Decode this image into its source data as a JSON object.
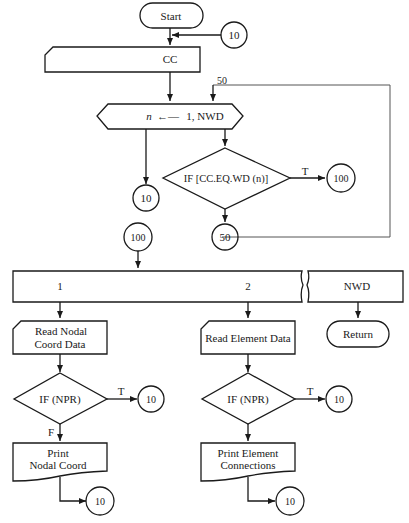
{
  "nodes": {
    "start": "Start",
    "connector_10_top": "10",
    "cc": "CC",
    "loop": {
      "var": "n",
      "range": "1, NWD"
    },
    "loop_label_50": "50",
    "if_cc": "IF [CC.EQ.WD (n)]",
    "if_cc_true": "T",
    "connector_100_right": "100",
    "connector_10_exit": "10",
    "connector_50": "50",
    "connector_100_entry": "100",
    "case_bar": {
      "case1": "1",
      "case2": "2",
      "case3": "NWD"
    },
    "read_nodal": {
      "line1": "Read Nodal",
      "line2": "Coord Data"
    },
    "read_element": "Read Element Data",
    "return": "Return",
    "if_npr_1": "IF (NPR)",
    "if_npr_1_true": "T",
    "if_npr_1_false": "F",
    "connector_10_npr1": "10",
    "if_npr_2": "IF (NPR)",
    "if_npr_2_true": "T",
    "connector_10_npr2": "10",
    "print_nodal": {
      "line1": "Print",
      "line2": "Nodal Coord"
    },
    "print_element": {
      "line1": "Print  Element",
      "line2": "Connections"
    },
    "connector_10_print1": "10",
    "connector_10_print2": "10"
  },
  "colors": {
    "stroke": "#1a1a1a",
    "loop_line": "#555555",
    "background": "#ffffff"
  }
}
